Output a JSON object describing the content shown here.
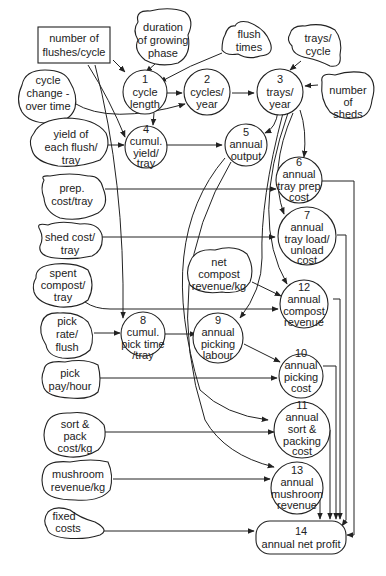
{
  "diagram": {
    "type": "influence-diagram",
    "colors": {
      "stroke": "#222222",
      "background": "#ffffff"
    },
    "inputs": [
      {
        "id": "flushes",
        "lines": [
          "number of",
          "flushes/cycle"
        ],
        "shape": "rectangle"
      },
      {
        "id": "duration",
        "lines": [
          "duration",
          "of growing",
          "phase"
        ],
        "shape": "cloud"
      },
      {
        "id": "flushtimes",
        "lines": [
          "flush",
          "times"
        ],
        "shape": "cloud"
      },
      {
        "id": "trayscycle",
        "lines": [
          "trays/",
          "cycle"
        ],
        "shape": "cloud"
      },
      {
        "id": "cyclechange",
        "lines": [
          "cycle",
          "change -",
          "over time"
        ],
        "shape": "cloud"
      },
      {
        "id": "sheds",
        "lines": [
          "number",
          "of",
          "sheds"
        ],
        "shape": "cloud"
      },
      {
        "id": "yieldflush",
        "lines": [
          "yield of",
          "each flush/",
          "tray"
        ],
        "shape": "cloud"
      },
      {
        "id": "prepcost",
        "lines": [
          "prep.",
          "cost/tray"
        ],
        "shape": "cloud"
      },
      {
        "id": "shedcost",
        "lines": [
          "shed cost/",
          "tray"
        ],
        "shape": "cloud"
      },
      {
        "id": "spentcompost",
        "lines": [
          "spent",
          "compost/",
          "tray"
        ],
        "shape": "cloud"
      },
      {
        "id": "netcompost",
        "lines": [
          "net",
          "compost",
          "revenue/kg"
        ],
        "shape": "cloud"
      },
      {
        "id": "pickrate",
        "lines": [
          "pick",
          "rate/",
          "flush"
        ],
        "shape": "cloud"
      },
      {
        "id": "pickpay",
        "lines": [
          "pick",
          "pay/hour"
        ],
        "shape": "cloud"
      },
      {
        "id": "sortpack",
        "lines": [
          "sort &",
          "pack",
          "cost/kg"
        ],
        "shape": "cloud"
      },
      {
        "id": "mushrev",
        "lines": [
          "mushroom",
          "revenue/kg"
        ],
        "shape": "cloud"
      },
      {
        "id": "fixed",
        "lines": [
          "fixed",
          "costs"
        ],
        "shape": "cloud"
      }
    ],
    "nodes": [
      {
        "num": "1",
        "lines": [
          "1",
          "cycle",
          "length"
        ]
      },
      {
        "num": "2",
        "lines": [
          "2",
          "cycles/",
          "year"
        ]
      },
      {
        "num": "3",
        "lines": [
          "3",
          "trays/",
          "year"
        ]
      },
      {
        "num": "4",
        "lines": [
          "4",
          "cumul.",
          "yield/",
          "tray"
        ]
      },
      {
        "num": "5",
        "lines": [
          "5",
          "annual",
          "output"
        ]
      },
      {
        "num": "6",
        "lines": [
          "6",
          "annual",
          "tray prep",
          "cost"
        ]
      },
      {
        "num": "7",
        "lines": [
          "7",
          "annual",
          "tray load/",
          "unload",
          "cost"
        ]
      },
      {
        "num": "8",
        "lines": [
          "8",
          "cumul.",
          "pick time",
          "/tray"
        ]
      },
      {
        "num": "9",
        "lines": [
          "9",
          "annual",
          "picking",
          "labour"
        ]
      },
      {
        "num": "10",
        "lines": [
          "10",
          "annual",
          "picking",
          "cost"
        ]
      },
      {
        "num": "11",
        "lines": [
          "11",
          "annual",
          "sort &",
          "packing",
          "cost"
        ]
      },
      {
        "num": "12",
        "lines": [
          "12",
          "annual",
          "compost",
          "revenue"
        ]
      },
      {
        "num": "13",
        "lines": [
          "13",
          "annual",
          "mushroom",
          "revenue"
        ]
      },
      {
        "num": "14",
        "lines": [
          "14",
          "annual net profit"
        ]
      }
    ]
  }
}
